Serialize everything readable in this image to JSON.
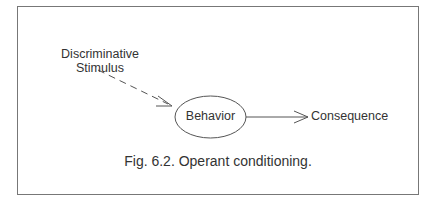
{
  "diagram": {
    "nodes": {
      "stimulus_line1": "Discriminative",
      "stimulus_line2": "Stimulus",
      "behavior": "Behavior",
      "consequence": "Consequence"
    },
    "edges": [
      {
        "from": "Discriminative Stimulus",
        "to": "Behavior",
        "style": "dashed"
      },
      {
        "from": "Behavior",
        "to": "Consequence",
        "style": "solid"
      }
    ],
    "caption": "Fig. 6.2. Operant conditioning."
  }
}
